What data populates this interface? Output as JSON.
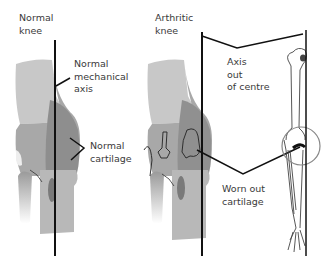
{
  "left_panel": {
    "title_line1": "Normal",
    "title_line2": "knee",
    "axis_label_line1": "Normal",
    "axis_label_line2": "mechanical",
    "axis_label_line3": "axis",
    "cartilage_label_line1": "Normal",
    "cartilage_label_line2": "cartilage"
  },
  "right_panel": {
    "title_line1": "Arthritic",
    "title_line2": "knee",
    "axis_label_line1": "Axis",
    "axis_label_line2": "out",
    "axis_label_line3": "of centre",
    "cartilage_label_line1": "Worn out",
    "cartilage_label_line2": "cartilage"
  },
  "colors": {
    "bone_light": "#c4c4c4",
    "bone_mid": "#9c9c9c",
    "bone_dark": "#7e7e7e",
    "line": "#111111",
    "text": "#3a3a3a"
  }
}
